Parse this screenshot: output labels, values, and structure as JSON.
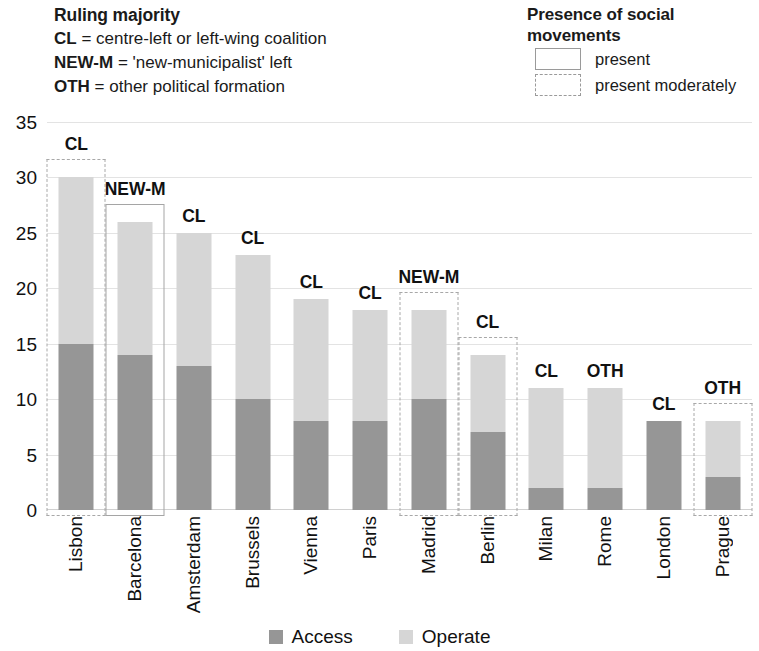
{
  "majority_legend": {
    "title": "Ruling majority",
    "entries": [
      {
        "code": "CL",
        "desc": " = centre-left or left-wing coalition"
      },
      {
        "code": "NEW-M",
        "desc": " = 'new-municipalist' left"
      },
      {
        "code": "OTH",
        "desc": " = other political formation"
      }
    ]
  },
  "social_legend": {
    "title": "Presence of social movements",
    "entries": [
      {
        "label": "present",
        "style": "solid"
      },
      {
        "label": "present moderately",
        "style": "dashed"
      }
    ]
  },
  "series_legend": [
    {
      "label": "Access",
      "color": "#969696"
    },
    {
      "label": "Operate",
      "color": "#d6d6d6"
    }
  ],
  "colors": {
    "access": "#969696",
    "operate": "#d6d6d6",
    "grid": "#e3e3e3",
    "box_present": "#a5a5a5",
    "box_moderate": "#a8a8a8",
    "text": "#111111"
  },
  "chart_data": {
    "type": "bar",
    "subtype": "stacked-bar",
    "title": "",
    "xlabel": "",
    "ylabel": "",
    "ylim": [
      0,
      35
    ],
    "yticks": [
      0,
      5,
      10,
      15,
      20,
      25,
      30,
      35
    ],
    "grid": true,
    "legend_position": "bottom",
    "categories": [
      "Lisbon",
      "Barcelona",
      "Amsterdam",
      "Brussels",
      "Vienna",
      "Paris",
      "Madrid",
      "Berlin",
      "Milan",
      "Rome",
      "London",
      "Prague"
    ],
    "series": [
      {
        "name": "Access",
        "values": [
          15,
          14,
          13,
          10,
          8,
          8,
          10,
          7,
          2,
          2,
          8,
          3
        ]
      },
      {
        "name": "Operate",
        "values": [
          15,
          12,
          12,
          13,
          11,
          10,
          8,
          7,
          9,
          9,
          0,
          5
        ]
      }
    ],
    "totals": [
      30,
      26,
      25,
      23,
      19,
      18,
      18,
      14,
      11,
      11,
      8,
      8
    ],
    "annotations": {
      "ruling_majority": [
        "CL",
        "NEW-M",
        "CL",
        "CL",
        "CL",
        "CL",
        "NEW-M",
        "CL",
        "CL",
        "OTH",
        "CL",
        "OTH"
      ],
      "social_movements": [
        "moderate",
        "present",
        "none",
        "none",
        "none",
        "none",
        "moderate",
        "moderate",
        "none",
        "none",
        "none",
        "moderate"
      ]
    }
  }
}
